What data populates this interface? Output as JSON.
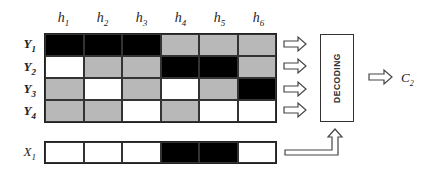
{
  "columns": [
    {
      "name": "h",
      "sub": "1"
    },
    {
      "name": "h",
      "sub": "2"
    },
    {
      "name": "h",
      "sub": "3"
    },
    {
      "name": "h",
      "sub": "4"
    },
    {
      "name": "h",
      "sub": "5"
    },
    {
      "name": "h",
      "sub": "6"
    }
  ],
  "rows": [
    {
      "name": "Y",
      "sub": "1",
      "cells": [
        "B",
        "B",
        "B",
        "G",
        "G",
        "G"
      ]
    },
    {
      "name": "Y",
      "sub": "2",
      "cells": [
        "W",
        "G",
        "G",
        "B",
        "B",
        "G"
      ]
    },
    {
      "name": "Y",
      "sub": "3",
      "cells": [
        "G",
        "W",
        "G",
        "W",
        "G",
        "B"
      ]
    },
    {
      "name": "Y",
      "sub": "4",
      "cells": [
        "G",
        "G",
        "W",
        "G",
        "W",
        "W"
      ]
    }
  ],
  "input_row": {
    "name": "X",
    "sub": "1",
    "cells": [
      "W",
      "W",
      "W",
      "B",
      "B",
      "W"
    ]
  },
  "decoder": {
    "label": "DECODING"
  },
  "output": {
    "name": "C",
    "sub": "2"
  },
  "legend_colors": {
    "B": "#000000",
    "G": "#b8b8b8",
    "W": "#ffffff"
  }
}
